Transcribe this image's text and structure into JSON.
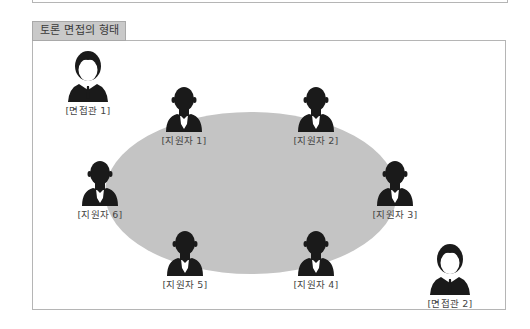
{
  "title": "토론 면접의 형태",
  "colors": {
    "table": "#c4c4c4",
    "silhouette": "#1a1a1a",
    "title_tab_bg": "#c9c9c9",
    "border": "#b5b5b5"
  },
  "table": {
    "shape": "ellipse",
    "label": ""
  },
  "interviewers": [
    {
      "label": "[면접관 1]",
      "icon": "interviewer-icon"
    },
    {
      "label": "[면접관 2]",
      "icon": "interviewer-icon"
    }
  ],
  "applicants": [
    {
      "label": "[지원자 1]",
      "icon": "applicant-icon"
    },
    {
      "label": "[지원자 2]",
      "icon": "applicant-icon"
    },
    {
      "label": "[지원자 3]",
      "icon": "applicant-icon"
    },
    {
      "label": "[지원자 4]",
      "icon": "applicant-icon"
    },
    {
      "label": "[지원자 5]",
      "icon": "applicant-icon"
    },
    {
      "label": "[지원자 6]",
      "icon": "applicant-icon"
    }
  ]
}
